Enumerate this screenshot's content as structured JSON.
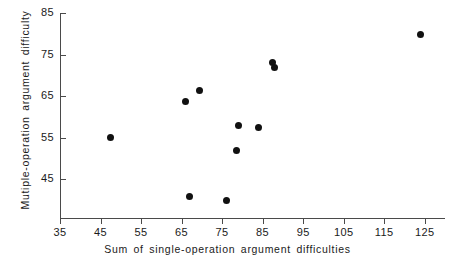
{
  "chart_data": {
    "type": "scatter",
    "title": "",
    "xlabel": "Sum of single-operation argument difficulties",
    "ylabel": "Mutiple-operation argument difficulty",
    "xlim": [
      35,
      130
    ],
    "ylim": [
      38,
      85
    ],
    "xticks": [
      35,
      45,
      55,
      65,
      75,
      85,
      95,
      105,
      115,
      125
    ],
    "yticks": [
      45,
      55,
      65,
      75,
      85
    ],
    "xtick_labels": [
      "35",
      "45",
      "55",
      "65",
      "75",
      "85",
      "95",
      "105",
      "115",
      "125"
    ],
    "ytick_labels": [
      "45",
      "55",
      "65",
      "75",
      "85"
    ],
    "grid": false,
    "legend": null,
    "marker": {
      "shape": "circle",
      "color": "#111111",
      "size": 7
    },
    "points": [
      {
        "x": 47.5,
        "y": 54.9
      },
      {
        "x": 66.0,
        "y": 63.7
      },
      {
        "x": 69.5,
        "y": 66.4
      },
      {
        "x": 67.0,
        "y": 40.7
      },
      {
        "x": 76.0,
        "y": 39.7
      },
      {
        "x": 78.5,
        "y": 51.8
      },
      {
        "x": 79.0,
        "y": 57.9
      },
      {
        "x": 84.0,
        "y": 57.4
      },
      {
        "x": 87.5,
        "y": 73.1
      },
      {
        "x": 88.0,
        "y": 71.9
      },
      {
        "x": 124.0,
        "y": 79.7
      },
      {
        "x": 134.0,
        "y": 72.4
      }
    ]
  },
  "axes": {
    "line_color": "#4a4a4a"
  }
}
